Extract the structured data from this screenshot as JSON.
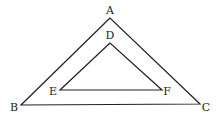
{
  "diagram": {
    "type": "nested-triangles",
    "stroke_color": "#222222",
    "background": "#ffffff",
    "outer_triangle": {
      "name": "ABC",
      "vertices": [
        {
          "label": "A",
          "x": 110,
          "y": 18,
          "label_x": 110,
          "label_y": 14
        },
        {
          "label": "B",
          "x": 21,
          "y": 105,
          "label_x": 14,
          "label_y": 111
        },
        {
          "label": "C",
          "x": 200,
          "y": 104,
          "label_x": 206,
          "label_y": 111
        }
      ]
    },
    "inner_triangle": {
      "name": "DEF",
      "vertices": [
        {
          "label": "D",
          "x": 110,
          "y": 43,
          "label_x": 110,
          "label_y": 39
        },
        {
          "label": "E",
          "x": 60,
          "y": 90,
          "label_x": 53,
          "label_y": 95
        },
        {
          "label": "F",
          "x": 162,
          "y": 90,
          "label_x": 167,
          "label_y": 95
        }
      ]
    }
  }
}
